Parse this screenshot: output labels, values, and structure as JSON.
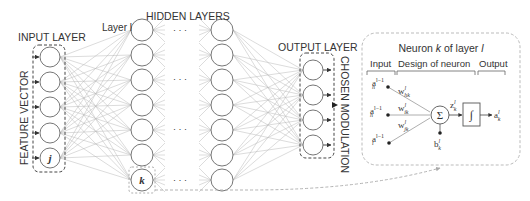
{
  "labels": {
    "input_layer": "INPUT LAYER",
    "hidden_layers": "HIDDEN LAYERS",
    "layer_l": "Layer l",
    "output_layer": "OUTPUT LAYER",
    "feature_vector": "FEATURE VECTOR",
    "chosen_modulation": "CHOSEN MODULATION",
    "ellipsis": "· · ·"
  },
  "network": {
    "input_nodes": 5,
    "hidden_layer_nodes": 7,
    "visible_hidden_layers": 2,
    "output_nodes": 4,
    "input_marked_node": "j",
    "hidden_marked_node": "k"
  },
  "neuron_detail": {
    "title": "Neuron k of layer l",
    "title_parts": {
      "pre": "Neuron ",
      "k": "k",
      "mid": " of layer ",
      "l": "l"
    },
    "sections": {
      "input": "Input",
      "design": "Design of neuron",
      "output": "Output"
    },
    "inputs": [
      {
        "base": "a",
        "sub": "h",
        "sup": "l−1"
      },
      {
        "base": "a",
        "sub": "h",
        "sup": "l−1"
      },
      {
        "base": "a",
        "sub": "i",
        "sup": "l−1"
      }
    ],
    "weights": [
      {
        "base": "w",
        "sub": "hk",
        "sup": "l"
      },
      {
        "base": "w",
        "sub": "ik",
        "sup": "l"
      },
      {
        "base": "w",
        "sub": "jk",
        "sup": "l"
      }
    ],
    "sum_symbol": "Σ",
    "z": {
      "base": "z",
      "sub": "k",
      "sup": "l"
    },
    "bias": {
      "base": "b",
      "sub": "k",
      "sup": "l"
    },
    "activation_symbol": "∫",
    "output": {
      "base": "a",
      "sub": "k",
      "sup": "l"
    }
  },
  "colors": {
    "stroke": "#555555",
    "edge": "#b0b0b0",
    "dashed_gray": "#aaaaaa",
    "text": "#333333"
  }
}
